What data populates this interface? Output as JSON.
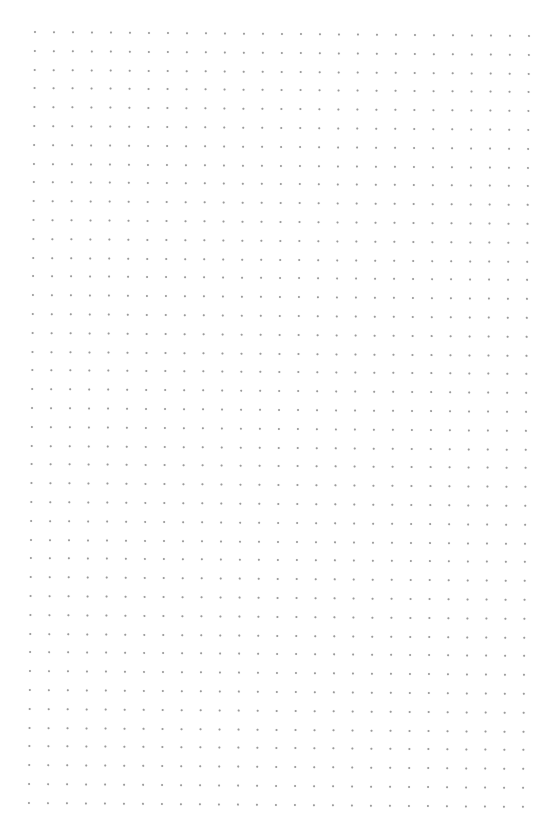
{
  "page": {
    "type": "dot-grid-paper",
    "background_color": "#ffffff",
    "dot_color": "#9a9a9a"
  },
  "grid": {
    "columns": 27,
    "rows": 42
  }
}
